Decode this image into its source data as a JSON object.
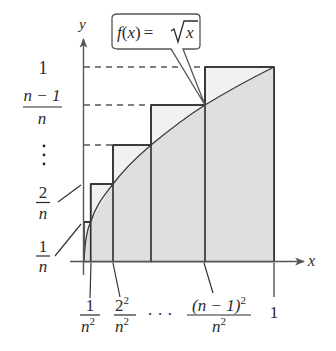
{
  "figure": {
    "type": "riemann-sum-diagram",
    "function_label": {
      "f": "f",
      "open": "(",
      "x": "x",
      "close": ")",
      "eq": "=",
      "sqrt_arg": "x"
    },
    "axes": {
      "x_label": "x",
      "y_label": "y"
    },
    "colors": {
      "line": "#3a3a3a",
      "rect_fill": "#e2e2e2",
      "rect_top_fill": "#f1f1f1",
      "dash": "#555555"
    },
    "y_labels": [
      {
        "id": "one",
        "text": "1"
      },
      {
        "id": "n-minus-1-over-n",
        "num": "n − 1",
        "den": "n"
      },
      {
        "id": "vdots",
        "text": "⋮"
      },
      {
        "id": "two-over-n",
        "num": "2",
        "den": "n"
      },
      {
        "id": "one-over-n",
        "num": "1",
        "den": "n"
      }
    ],
    "x_labels": [
      {
        "id": "one-over-n2",
        "num": "1",
        "den_base": "n",
        "den_exp": "2"
      },
      {
        "id": "two2-over-n2",
        "num_base": "2",
        "num_exp": "2",
        "den_base": "n",
        "den_exp": "2"
      },
      {
        "id": "dots",
        "text": "· · ·"
      },
      {
        "id": "n-1-sq-over-n2",
        "num_base": "(n − 1)",
        "num_exp": "2",
        "den_base": "n",
        "den_exp": "2"
      },
      {
        "id": "one",
        "text": "1"
      }
    ],
    "rectangles": [
      {
        "x_from": "0",
        "x_to": "1/n²",
        "height": "1/n"
      },
      {
        "x_from": "1/n²",
        "x_to": "2²/n²",
        "height": "2/n"
      },
      {
        "x_from": "2²/n²",
        "x_to": "3²/n²",
        "height": "3/n"
      },
      {
        "x_from": "3²/n²",
        "x_to": "(n−1)²/n²",
        "height": "(n−1)/n"
      },
      {
        "x_from": "(n−1)²/n²",
        "x_to": "1",
        "height": "1"
      }
    ]
  }
}
